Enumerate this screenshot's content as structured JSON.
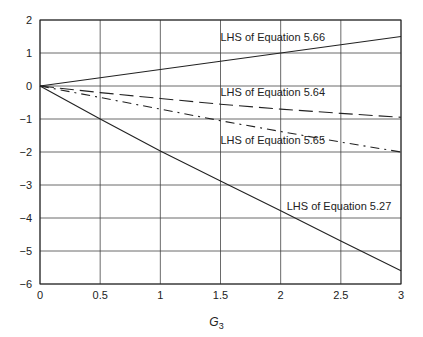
{
  "chart_data": {
    "type": "line",
    "title": "",
    "xlabel": "G",
    "xlabel_subscript": "3",
    "ylabel": "",
    "xlim": [
      0,
      3
    ],
    "ylim": [
      -6,
      2
    ],
    "grid": true,
    "legend": "none (inline annotations)",
    "x_ticks": [
      "0",
      "0.5",
      "1",
      "1.5",
      "2",
      "2.5",
      "3"
    ],
    "y_ticks": [
      "2",
      "1",
      "0",
      "−1",
      "−2",
      "−3",
      "−4",
      "−5",
      "−6"
    ],
    "x": [
      0,
      0.5,
      1,
      1.5,
      2,
      2.5,
      3
    ],
    "series": [
      {
        "name": "LHS of Equation 5.66",
        "style": "solid",
        "values": [
          0,
          0.25,
          0.5,
          0.75,
          1.0,
          1.25,
          1.5
        ],
        "label_pos": [
          1.5,
          1.35
        ]
      },
      {
        "name": "LHS of Equation 5.64",
        "style": "long-dash",
        "values": [
          0,
          -0.2,
          -0.38,
          -0.55,
          -0.7,
          -0.83,
          -0.95
        ],
        "label_pos": [
          1.5,
          -0.3
        ]
      },
      {
        "name": "LHS of Equation 5.65",
        "style": "dash-dot",
        "values": [
          0,
          -0.35,
          -0.7,
          -1.05,
          -1.38,
          -1.7,
          -2.0
        ],
        "label_pos": [
          1.5,
          -1.75
        ]
      },
      {
        "name": "LHS of Equation 5.27",
        "style": "solid",
        "values": [
          0,
          -1.0,
          -1.97,
          -2.88,
          -3.78,
          -4.7,
          -5.6
        ],
        "label_pos": [
          2.05,
          -3.75
        ]
      }
    ]
  }
}
